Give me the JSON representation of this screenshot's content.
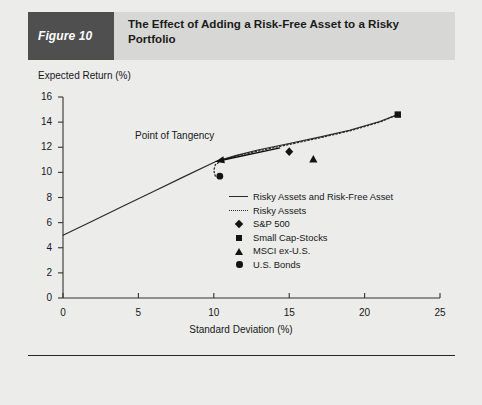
{
  "figure": {
    "tab_label": "Figure 10",
    "title": "The Effect of Adding a Risk-Free Asset to a Risky Portfolio"
  },
  "colors": {
    "page_background": "#ececeb",
    "header_band": "#d7d7d5",
    "figure_tab": "#4f4f4f",
    "figure_tab_text": "#ffffff",
    "ink": "#16181a",
    "marker": "#141414",
    "line": "#2a2a2a",
    "rule": "#262626"
  },
  "annotations": [
    {
      "name": "point-of-tangency",
      "text": "Point of Tangency",
      "arrow_from": [
        14.4,
        11.95
      ],
      "arrow_to": [
        10.1,
        10.85
      ]
    }
  ],
  "legend": {
    "position": "inside-right",
    "entries": [
      {
        "key": "solid-line",
        "label": "Risky Assets and Risk-Free Asset"
      },
      {
        "key": "dotted-line",
        "label": "Risky Assets"
      },
      {
        "key": "diamond",
        "label": "S&P 500"
      },
      {
        "key": "square",
        "label": "Small Cap-Stocks"
      },
      {
        "key": "triangle",
        "label": "MSCI ex-U.S."
      },
      {
        "key": "circle",
        "label": "U.S. Bonds"
      }
    ]
  },
  "chart_data": {
    "type": "line",
    "title": "The Effect of Adding a Risk-Free Asset to a Risky Portfolio",
    "xlabel": "Standard Deviation (%)",
    "ylabel": "Expected Return (%)",
    "xlim": [
      0,
      25
    ],
    "ylim": [
      0,
      16
    ],
    "xticks": [
      0,
      5,
      10,
      15,
      20,
      25
    ],
    "yticks": [
      0,
      2,
      4,
      6,
      8,
      10,
      12,
      14,
      16
    ],
    "grid": false,
    "risk_free_rate": 5.0,
    "tangency_point": {
      "x": 10.1,
      "y": 10.85
    },
    "series": [
      {
        "name": "Risky Assets and Risk-Free Asset",
        "style": "solid",
        "points": [
          [
            0.0,
            5.0
          ],
          [
            2.0,
            6.15
          ],
          [
            4.0,
            7.32
          ],
          [
            6.0,
            8.48
          ],
          [
            8.0,
            9.64
          ],
          [
            10.1,
            10.85
          ],
          [
            11.5,
            11.35
          ],
          [
            13.0,
            11.8
          ],
          [
            15.0,
            12.3
          ],
          [
            17.0,
            12.8
          ],
          [
            19.0,
            13.35
          ],
          [
            21.0,
            14.05
          ],
          [
            22.2,
            14.6
          ]
        ]
      },
      {
        "name": "Risky Assets",
        "style": "dotted",
        "points": [
          [
            10.1,
            9.7
          ],
          [
            10.0,
            10.15
          ],
          [
            10.1,
            10.6
          ],
          [
            10.5,
            10.95
          ],
          [
            11.5,
            11.3
          ],
          [
            13.0,
            11.72
          ],
          [
            15.0,
            12.22
          ],
          [
            17.0,
            12.74
          ],
          [
            19.0,
            13.3
          ],
          [
            21.0,
            14.0
          ],
          [
            22.2,
            14.6
          ]
        ]
      }
    ],
    "markers": [
      {
        "name": "S&P 500",
        "shape": "diamond",
        "x": 15.0,
        "y": 11.65
      },
      {
        "name": "Small Cap-Stocks",
        "shape": "square",
        "x": 22.2,
        "y": 14.6
      },
      {
        "name": "MSCI ex-U.S.",
        "shape": "triangle",
        "x": 16.6,
        "y": 11.05
      },
      {
        "name": "U.S. Bonds",
        "shape": "circle",
        "x": 10.4,
        "y": 9.7
      }
    ]
  }
}
